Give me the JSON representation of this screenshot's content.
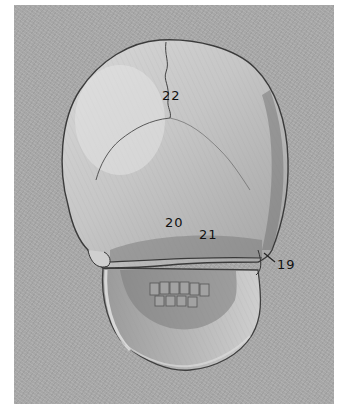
{
  "image": {
    "subject": "Pencil drawing of a human skull, posterior view, on grey paper",
    "colors": {
      "border": "#ffffff",
      "paper": "#a9a9a9",
      "bone_light": "#d2d2d2",
      "bone_mid": "#b8b8b8",
      "shadow": "#6e6e6e",
      "line": "#3a3a3a",
      "label": "#111111"
    }
  },
  "labels": [
    {
      "id": "22",
      "text": "22",
      "x": 162,
      "y": 89
    },
    {
      "id": "20",
      "text": "20",
      "x": 165,
      "y": 216
    },
    {
      "id": "21",
      "text": "21",
      "x": 199,
      "y": 228
    },
    {
      "id": "19",
      "text": "19",
      "x": 277,
      "y": 258
    }
  ]
}
